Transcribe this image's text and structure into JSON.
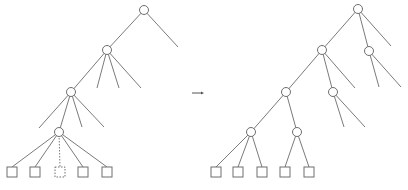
{
  "diagram": {
    "colors": {
      "stroke": "#6e6e6e",
      "background": "#ffffff"
    },
    "left_tree": {
      "nodes": [
        {
          "id": "L0",
          "x": 144,
          "y": 10
        },
        {
          "id": "L1",
          "x": 107,
          "y": 50
        },
        {
          "id": "L2",
          "x": 71,
          "y": 92
        },
        {
          "id": "L3",
          "x": 59,
          "y": 132
        }
      ],
      "edges": [
        {
          "from": [
            144,
            10
          ],
          "to": [
            107,
            50
          ]
        },
        {
          "from": [
            144,
            10
          ],
          "to": [
            178,
            47
          ]
        },
        {
          "from": [
            107,
            50
          ],
          "to": [
            71,
            92
          ]
        },
        {
          "from": [
            107,
            50
          ],
          "to": [
            97,
            88
          ]
        },
        {
          "from": [
            107,
            50
          ],
          "to": [
            119,
            88
          ]
        },
        {
          "from": [
            107,
            50
          ],
          "to": [
            141,
            88
          ]
        },
        {
          "from": [
            71,
            92
          ],
          "to": [
            59,
            132
          ]
        },
        {
          "from": [
            71,
            92
          ],
          "to": [
            39,
            128
          ]
        },
        {
          "from": [
            71,
            92
          ],
          "to": [
            82,
            127
          ]
        },
        {
          "from": [
            71,
            92
          ],
          "to": [
            104,
            127
          ]
        },
        {
          "from": [
            59,
            132
          ],
          "to": [
            12,
            167
          ]
        },
        {
          "from": [
            59,
            132
          ],
          "to": [
            35,
            167
          ]
        },
        {
          "from": [
            59,
            132
          ],
          "to": [
            60,
            167
          ],
          "style": "dotted"
        },
        {
          "from": [
            59,
            132
          ],
          "to": [
            83,
            167
          ]
        },
        {
          "from": [
            59,
            132
          ],
          "to": [
            107,
            167
          ]
        }
      ],
      "leaves": [
        {
          "x": 12,
          "y": 172
        },
        {
          "x": 35,
          "y": 172
        },
        {
          "x": 60,
          "y": 172,
          "style": "dashed"
        },
        {
          "x": 83,
          "y": 172
        },
        {
          "x": 107,
          "y": 172
        }
      ]
    },
    "arrow": {
      "from": [
        192,
        93
      ],
      "to": [
        204,
        93
      ]
    },
    "right_tree": {
      "nodes": [
        {
          "id": "R0",
          "x": 358,
          "y": 9
        },
        {
          "id": "R1",
          "x": 322,
          "y": 50
        },
        {
          "id": "R2",
          "x": 369,
          "y": 51
        },
        {
          "id": "R3",
          "x": 286,
          "y": 92
        },
        {
          "id": "R4",
          "x": 333,
          "y": 92
        },
        {
          "id": "R5",
          "x": 251,
          "y": 132
        },
        {
          "id": "R6",
          "x": 297,
          "y": 132
        }
      ],
      "edges": [
        {
          "from": [
            358,
            9
          ],
          "to": [
            322,
            50
          ]
        },
        {
          "from": [
            358,
            9
          ],
          "to": [
            369,
            51
          ]
        },
        {
          "from": [
            358,
            9
          ],
          "to": [
            391,
            46
          ]
        },
        {
          "from": [
            369,
            51
          ],
          "to": [
            379,
            87
          ]
        },
        {
          "from": [
            369,
            51
          ],
          "to": [
            401,
            87
          ]
        },
        {
          "from": [
            322,
            50
          ],
          "to": [
            286,
            92
          ]
        },
        {
          "from": [
            322,
            50
          ],
          "to": [
            333,
            92
          ]
        },
        {
          "from": [
            322,
            50
          ],
          "to": [
            355,
            88
          ]
        },
        {
          "from": [
            333,
            92
          ],
          "to": [
            344,
            127
          ]
        },
        {
          "from": [
            333,
            92
          ],
          "to": [
            365,
            127
          ]
        },
        {
          "from": [
            286,
            92
          ],
          "to": [
            251,
            132
          ]
        },
        {
          "from": [
            286,
            92
          ],
          "to": [
            297,
            132
          ]
        },
        {
          "from": [
            251,
            132
          ],
          "to": [
            216,
            167
          ]
        },
        {
          "from": [
            251,
            132
          ],
          "to": [
            238,
            167
          ]
        },
        {
          "from": [
            251,
            132
          ],
          "to": [
            262,
            167
          ]
        },
        {
          "from": [
            297,
            132
          ],
          "to": [
            285,
            167
          ]
        },
        {
          "from": [
            297,
            132
          ],
          "to": [
            309,
            167
          ]
        }
      ],
      "leaves": [
        {
          "x": 216,
          "y": 172
        },
        {
          "x": 238,
          "y": 172
        },
        {
          "x": 262,
          "y": 172
        },
        {
          "x": 285,
          "y": 172
        },
        {
          "x": 309,
          "y": 172
        }
      ]
    }
  }
}
